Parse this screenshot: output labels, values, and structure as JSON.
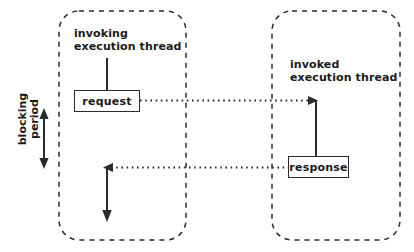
{
  "diagram": {
    "background_color": "#ffffff",
    "stroke_color": "#2b2b2b",
    "text_color": "#1a1a1a",
    "panels": [
      {
        "id": "invoking-thread-panel",
        "label": "invoking\nexecution thread",
        "style": "dashed-rounded-rectangle"
      },
      {
        "id": "invoked-thread-panel",
        "label": "invoked\nexecution thread",
        "style": "dashed-rounded-rectangle"
      }
    ],
    "boxes": [
      {
        "id": "request-box",
        "label": "request"
      },
      {
        "id": "response-box",
        "label": "response"
      }
    ],
    "annotations": [
      {
        "id": "blocking-period",
        "label": "blocking\nperiod",
        "orientation": "vertical",
        "marker": "double-headed-arrow"
      }
    ],
    "messages": [
      {
        "id": "request-message",
        "from": "request-box",
        "to": "invoked-thread-panel",
        "style": "dotted",
        "arrow": "right"
      },
      {
        "id": "response-message",
        "from": "response-box",
        "to": "invoking-thread-panel",
        "style": "dotted",
        "arrow": "left"
      }
    ],
    "lifelines": [
      {
        "id": "invoking-entry-line",
        "style": "solid"
      },
      {
        "id": "invoked-activation-line",
        "style": "solid"
      },
      {
        "id": "invoking-resume-line",
        "style": "solid",
        "arrow": "down"
      }
    ]
  }
}
